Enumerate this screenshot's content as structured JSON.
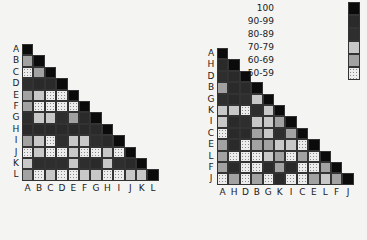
{
  "chart_data": [
    {
      "type": "heatmap",
      "title": "",
      "shape": "lower-triangular similarity matrix",
      "row_labels": [
        "A",
        "B",
        "C",
        "D",
        "E",
        "F",
        "G",
        "H",
        "I",
        "J",
        "K",
        "L"
      ],
      "col_labels": [
        "A",
        "B",
        "C",
        "D",
        "E",
        "F",
        "G",
        "H",
        "I",
        "J",
        "K",
        "L"
      ],
      "value_scale": {
        "5": "100",
        "4": "90-99",
        "3": "80-89",
        "2": "70-79",
        "1": "60-69",
        "0": "50-59"
      },
      "rows": [
        [
          5
        ],
        [
          1,
          5
        ],
        [
          0,
          1,
          5
        ],
        [
          3,
          4,
          4,
          5
        ],
        [
          1,
          2,
          0,
          0,
          5
        ],
        [
          1,
          0,
          0,
          0,
          0,
          5
        ],
        [
          3,
          2,
          2,
          3,
          1,
          4,
          5
        ],
        [
          4,
          4,
          4,
          4,
          4,
          4,
          4,
          5
        ],
        [
          1,
          2,
          0,
          3,
          2,
          2,
          3,
          4,
          5
        ],
        [
          0,
          2,
          0,
          0,
          2,
          0,
          0,
          2,
          0,
          5
        ],
        [
          2,
          3,
          3,
          3,
          2,
          3,
          4,
          2,
          3,
          4,
          5
        ],
        [
          1,
          0,
          2,
          0,
          0,
          2,
          2,
          0,
          0,
          2,
          2,
          5
        ]
      ]
    },
    {
      "type": "heatmap",
      "title": "",
      "shape": "lower-triangular similarity matrix (reordered)",
      "row_labels": [
        "A",
        "H",
        "D",
        "B",
        "G",
        "K",
        "I",
        "C",
        "E",
        "L",
        "F",
        "J"
      ],
      "col_labels": [
        "A",
        "H",
        "D",
        "B",
        "G",
        "K",
        "I",
        "C",
        "E",
        "L",
        "F",
        "J"
      ],
      "value_scale": {
        "5": "100",
        "4": "90-99",
        "3": "80-89",
        "2": "70-79",
        "1": "60-69",
        "0": "50-59"
      },
      "rows": [
        [
          5
        ],
        [
          4,
          5
        ],
        [
          3,
          4,
          5
        ],
        [
          1,
          4,
          4,
          5
        ],
        [
          3,
          4,
          3,
          2,
          5
        ],
        [
          2,
          2,
          0,
          3,
          2,
          5
        ],
        [
          2,
          4,
          3,
          2,
          2,
          1,
          5
        ],
        [
          0,
          4,
          4,
          1,
          2,
          3,
          1,
          5
        ],
        [
          1,
          4,
          0,
          1,
          1,
          2,
          2,
          0,
          5
        ],
        [
          1,
          0,
          0,
          0,
          2,
          1,
          0,
          1,
          0,
          5
        ],
        [
          1,
          4,
          0,
          0,
          4,
          1,
          4,
          0,
          0,
          1,
          5
        ],
        [
          0,
          1,
          0,
          1,
          0,
          4,
          0,
          0,
          1,
          2,
          1,
          5
        ]
      ]
    }
  ],
  "legend": {
    "position": "top-right",
    "entries": [
      {
        "label": "100",
        "code": 5
      },
      {
        "label": "90-99",
        "code": 4
      },
      {
        "label": "80-89",
        "code": 3
      },
      {
        "label": "70-79",
        "code": 2
      },
      {
        "label": "60-69",
        "code": 1
      },
      {
        "label": "50-59",
        "code": 0
      }
    ]
  }
}
